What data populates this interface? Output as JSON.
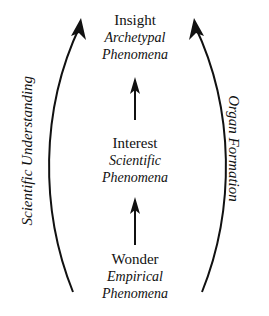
{
  "nodes": [
    {
      "title": "Insight",
      "subtitle_line1": "Archetypal",
      "subtitle_line2": "Phenomena"
    },
    {
      "title": "Interest",
      "subtitle_line1": "Scientific",
      "subtitle_line2": "Phenomena"
    },
    {
      "title": "Wonder",
      "subtitle_line1": "Empirical",
      "subtitle_line2": "Phenomena"
    }
  ],
  "side_labels": {
    "left": "Scientific Understanding",
    "right": "Organ Formation"
  },
  "colors": {
    "ink": "#111111",
    "background": "#ffffff"
  }
}
